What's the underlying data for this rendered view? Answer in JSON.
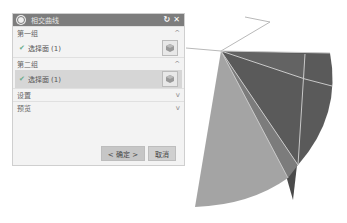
{
  "dialog": {
    "title": "相交曲线",
    "reset_icon": "↻",
    "close_icon": "✕",
    "sections": [
      {
        "label": "第一组",
        "state": "expanded",
        "chevron": "^",
        "selection": {
          "label": "选择面 (1)",
          "check": "✔"
        }
      },
      {
        "label": "第二组",
        "state": "expanded",
        "chevron": "^",
        "selection": {
          "label": "选择面 (1)",
          "check": "✔"
        }
      },
      {
        "label": "设置",
        "state": "collapsed",
        "chevron": "v"
      },
      {
        "label": "预览",
        "state": "collapsed",
        "chevron": "v"
      }
    ],
    "buttons": {
      "ok": "< 确定 >",
      "cancel": "取消"
    }
  },
  "viewport": {
    "colors": {
      "dark_face": "#5a5a5a",
      "mid_face": "#7a7a7a",
      "light_face": "#a4a4a4",
      "edge": "#c8c8c8",
      "spike": "#4a4a4a"
    }
  }
}
